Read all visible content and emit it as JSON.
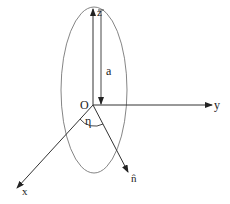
{
  "diagram": {
    "labels": {
      "z_axis": "z",
      "y_axis": "y",
      "x_axis": "x",
      "origin": "O",
      "semi_axis": "a",
      "angle": "η",
      "normal": "n̂"
    },
    "colors": {
      "stroke": "#333333",
      "ellipse": "#666666",
      "background": "#ffffff"
    }
  }
}
